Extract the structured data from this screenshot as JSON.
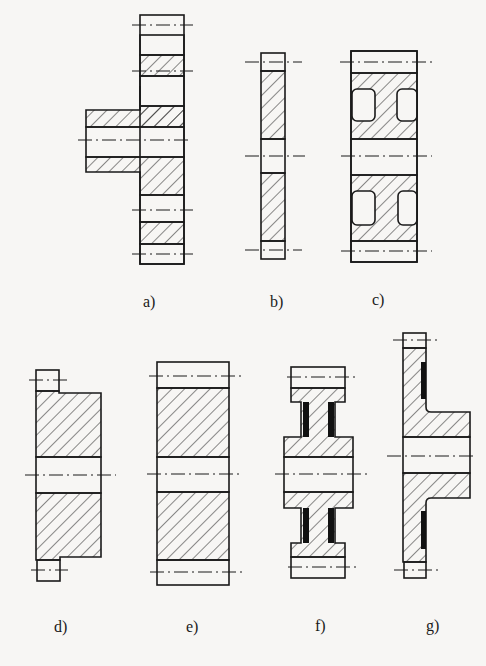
{
  "figure": {
    "type": "engineering cross-section drawings of sprockets",
    "background": "#f7f6f4",
    "line_color": "#1a1a1a",
    "hatch_color": "#1a1a1a",
    "panels": [
      {
        "id": "a",
        "label": "a)"
      },
      {
        "id": "b",
        "label": "b)"
      },
      {
        "id": "c",
        "label": "c)"
      },
      {
        "id": "d",
        "label": "d)"
      },
      {
        "id": "e",
        "label": "e)"
      },
      {
        "id": "f",
        "label": "f)"
      },
      {
        "id": "g",
        "label": "g)"
      }
    ]
  }
}
